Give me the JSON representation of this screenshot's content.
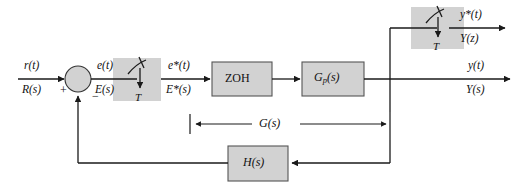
{
  "diagram": {
    "colors": {
      "block_fill": "#d2d2d2",
      "block_stroke": "#555555",
      "line": "#1a1a1a",
      "background": "#ffffff"
    },
    "blocks": [
      {
        "id": "sampler_input",
        "label": "T",
        "type": "sampler",
        "shape": "rect"
      },
      {
        "id": "zoh",
        "label": "ZOH",
        "type": "transfer",
        "shape": "rect"
      },
      {
        "id": "plant",
        "label": "G",
        "label_sub": "p",
        "label_tail": "(s)",
        "type": "transfer",
        "shape": "rect"
      },
      {
        "id": "sampler_output",
        "label": "T",
        "type": "sampler",
        "shape": "rect"
      },
      {
        "id": "feedback",
        "label": "H(s)",
        "type": "transfer",
        "shape": "rect"
      },
      {
        "id": "summer",
        "label": "",
        "type": "summing-junction",
        "shape": "circle"
      }
    ],
    "signals": {
      "input": {
        "time": "r(t)",
        "transform": "R(s)"
      },
      "error": {
        "time": "e(t)",
        "transform": "E(s)"
      },
      "sampled_error": {
        "time": "e*(t)",
        "transform": "E*(s)"
      },
      "output": {
        "time": "y(t)",
        "transform": "Y(s)"
      },
      "sampled_out": {
        "time": "y*(t)",
        "transform": "Y(z)"
      }
    },
    "summer_signs": {
      "input": "+",
      "feedback": "−"
    },
    "span_annotation": {
      "label": "G(s)"
    },
    "sampler_period_label": "T"
  }
}
